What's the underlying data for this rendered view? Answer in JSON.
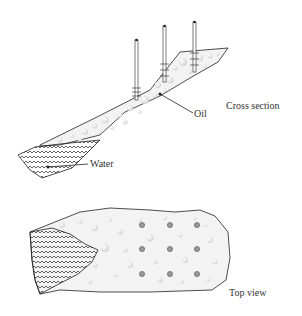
{
  "labels": {
    "oil": "Oil",
    "water": "Water",
    "cross_section": "Cross section",
    "top_view": "Top view"
  },
  "colors": {
    "outline": "#222222",
    "oil_fill": "#f2f2f2",
    "bubble": "#d9d9d9",
    "well_dot": "#888888",
    "water_wave": "#222222"
  },
  "cross_section": {
    "wells": [
      {
        "x": 136,
        "top": 40,
        "bottom": 100
      },
      {
        "x": 165,
        "top": 26,
        "bottom": 82
      },
      {
        "x": 194,
        "top": 22,
        "bottom": 70
      }
    ]
  },
  "top_view": {
    "well_grid": {
      "cols": [
        142,
        170,
        197
      ],
      "rows": [
        225,
        249,
        274
      ]
    }
  }
}
